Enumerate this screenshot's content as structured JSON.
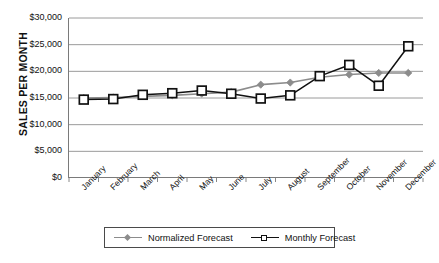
{
  "chart_data": {
    "type": "line",
    "title": "",
    "xlabel": "",
    "ylabel": "SALES PER MONTH",
    "categories": [
      "January",
      "February",
      "March",
      "April",
      "May",
      "June",
      "July",
      "August",
      "September",
      "October",
      "November",
      "December"
    ],
    "ylim": [
      0,
      30000
    ],
    "ytick_labels": [
      "$30,000",
      "$25,000",
      "$20,000",
      "$15,000",
      "$10,000",
      "$5,000",
      "$0"
    ],
    "ytick_values": [
      30000,
      25000,
      20000,
      15000,
      10000,
      5000,
      0
    ],
    "grid": "horizontal",
    "legend_position": "bottom",
    "series": [
      {
        "name": "Normalized Forecast",
        "color": "#8c8c8c",
        "marker": "diamond",
        "values": [
          15000,
          15100,
          15300,
          15500,
          15800,
          16100,
          17500,
          17900,
          18900,
          19400,
          19700,
          19700
        ]
      },
      {
        "name": "Monthly Forecast",
        "color": "#111111",
        "marker": "square",
        "values": [
          14700,
          14800,
          15600,
          15900,
          16400,
          15800,
          14900,
          15500,
          19100,
          21200,
          17300,
          24700
        ]
      }
    ]
  },
  "legend": {
    "entries": [
      {
        "label": "Normalized Forecast",
        "marker": "diamond-gray-icon"
      },
      {
        "label": "Monthly Forecast",
        "marker": "square-white-icon"
      }
    ]
  }
}
